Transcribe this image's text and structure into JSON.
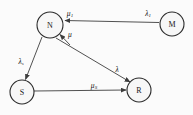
{
  "diagram": {
    "background_color": "#fbfbfb",
    "node_fill": "#f7f7f7",
    "node_stroke": "#2b2b2b",
    "edge_color": "#3d3d3d",
    "label_color": "#111111",
    "nodes": [
      {
        "id": "N",
        "label": "N",
        "cx": 50,
        "cy": 25,
        "r": 13
      },
      {
        "id": "M",
        "label": "M",
        "cx": 172,
        "cy": 24,
        "r": 12
      },
      {
        "id": "S",
        "label": "S",
        "cx": 22,
        "cy": 92,
        "r": 12
      },
      {
        "id": "R",
        "label": "R",
        "cx": 139,
        "cy": 90,
        "r": 12
      }
    ],
    "edges": [
      {
        "id": "m-to-n",
        "from": "M",
        "to": "N",
        "label": "λ",
        "label_sub": "1",
        "label_x": 148,
        "label_y": 13
      },
      {
        "id": "r-to-n",
        "from": "R",
        "to": "N",
        "label": "μ",
        "label_sub": "",
        "label_x": 70,
        "label_y": 34
      },
      {
        "id": "n-to-m-head",
        "from": "N",
        "to": "M",
        "label": "μ",
        "label_sub": "1",
        "label_x": 70,
        "label_y": 13
      },
      {
        "id": "n-to-s",
        "from": "N",
        "to": "S",
        "label": "λ",
        "label_sub": "s",
        "label_x": 21,
        "label_y": 61
      },
      {
        "id": "n-to-r",
        "from": "N",
        "to": "R",
        "label": "λ",
        "label_sub": "",
        "label_x": 117,
        "label_y": 69
      },
      {
        "id": "s-to-r",
        "from": "S",
        "to": "R",
        "label": "μ",
        "label_sub": "S",
        "label_x": 94,
        "label_y": 85
      }
    ]
  }
}
